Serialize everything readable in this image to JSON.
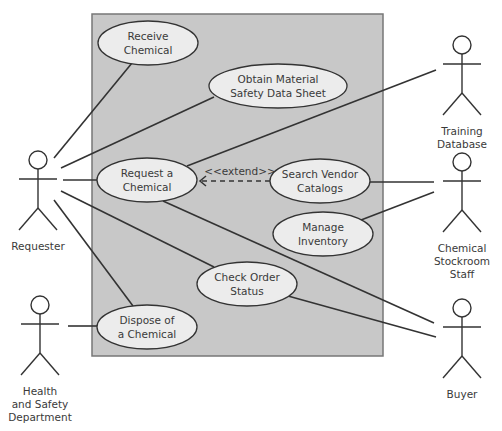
{
  "diagram": {
    "type": "uml-use-case",
    "colors": {
      "background": "#ffffff",
      "system_boundary_fill": "#c8c8c8",
      "system_boundary_stroke": "#777777",
      "use_case_fill": "#ececec",
      "line": "#333333",
      "text": "#3a3a3a"
    },
    "system_boundary": {
      "x": 92,
      "y": 14,
      "width": 291,
      "height": 342
    },
    "use_cases": [
      {
        "id": "receive",
        "lines": [
          "Receive",
          "Chemical"
        ],
        "cx": 148,
        "cy": 43,
        "rx": 50,
        "ry": 22
      },
      {
        "id": "msds",
        "lines": [
          "Obtain Material",
          "Safety Data Sheet"
        ],
        "cx": 278,
        "cy": 86,
        "rx": 69,
        "ry": 22
      },
      {
        "id": "request",
        "lines": [
          "Request a",
          "Chemical"
        ],
        "cx": 147,
        "cy": 180,
        "rx": 50,
        "ry": 22
      },
      {
        "id": "search",
        "lines": [
          "Search Vendor",
          "Catalogs"
        ],
        "cx": 320,
        "cy": 181,
        "rx": 50,
        "ry": 22
      },
      {
        "id": "inventory",
        "lines": [
          "Manage",
          "Inventory"
        ],
        "cx": 323,
        "cy": 234,
        "rx": 50,
        "ry": 22
      },
      {
        "id": "status",
        "lines": [
          "Check Order",
          "Status"
        ],
        "cx": 247,
        "cy": 284,
        "rx": 50,
        "ry": 22
      },
      {
        "id": "dispose",
        "lines": [
          "Dispose of",
          "a Chemical"
        ],
        "cx": 147,
        "cy": 327,
        "rx": 50,
        "ry": 22
      }
    ],
    "actors": [
      {
        "id": "requester",
        "lines": [
          "Requester"
        ],
        "x": 38,
        "head_y": 160
      },
      {
        "id": "training-db",
        "lines": [
          "Training",
          "Database"
        ],
        "x": 462,
        "head_y": 45
      },
      {
        "id": "stockroom",
        "lines": [
          "Chemical",
          "Stockroom",
          "Staff"
        ],
        "x": 462,
        "head_y": 162
      },
      {
        "id": "buyer",
        "lines": [
          "Buyer"
        ],
        "x": 462,
        "head_y": 308
      },
      {
        "id": "health-safety",
        "lines": [
          "Health",
          "and Safety",
          "Department"
        ],
        "x": 40,
        "head_y": 305
      }
    ],
    "associations": [
      {
        "from": "requester",
        "to": "receive",
        "x1": 54,
        "y1": 158,
        "x2": 132,
        "y2": 63
      },
      {
        "from": "requester",
        "to": "msds",
        "x1": 61,
        "y1": 168,
        "x2": 214,
        "y2": 97
      },
      {
        "from": "requester",
        "to": "request",
        "x1": 63,
        "y1": 180,
        "x2": 97,
        "y2": 180
      },
      {
        "from": "requester",
        "to": "status",
        "x1": 61,
        "y1": 191,
        "x2": 214,
        "y2": 267
      },
      {
        "from": "requester",
        "to": "dispose",
        "x1": 54,
        "y1": 200,
        "x2": 133,
        "y2": 306
      },
      {
        "from": "request",
        "to": "training-db",
        "x1": 187,
        "y1": 166,
        "x2": 436,
        "y2": 70
      },
      {
        "from": "search",
        "to": "stockroom",
        "x1": 370,
        "y1": 182,
        "x2": 434,
        "y2": 182
      },
      {
        "from": "inventory",
        "to": "stockroom",
        "x1": 361,
        "y1": 220,
        "x2": 434,
        "y2": 192
      },
      {
        "from": "request",
        "to": "buyer",
        "x1": 163,
        "y1": 201,
        "x2": 434,
        "y2": 323
      },
      {
        "from": "status",
        "to": "buyer",
        "x1": 288,
        "y1": 296,
        "x2": 436,
        "y2": 337
      },
      {
        "from": "health-safety",
        "to": "dispose",
        "x1": 68,
        "y1": 326,
        "x2": 97,
        "y2": 326
      }
    ],
    "extend": {
      "label": "<<extend>>",
      "from": "search",
      "to": "request",
      "x1": 270,
      "y1": 181,
      "x2": 200,
      "y2": 181,
      "label_x": 240,
      "label_y": 175
    }
  }
}
